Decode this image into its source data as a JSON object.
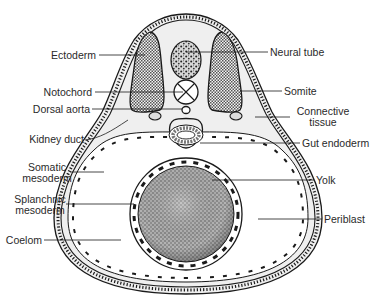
{
  "figure": {
    "caption_fragment": ""
  },
  "labels": {
    "left": [
      {
        "id": "ectoderm",
        "text": "Ectoderm"
      },
      {
        "id": "notochord",
        "text": "Notochord"
      },
      {
        "id": "dorsal_aorta",
        "text": "Dorsal aorta"
      },
      {
        "id": "kidney_duct",
        "text": "Kidney duct"
      },
      {
        "id": "somatic_mesoderm",
        "line1": "Somatic",
        "line2": "mesoderm"
      },
      {
        "id": "splanchnic_mesoderm",
        "line1": "Splanchnic",
        "line2": "mesoderm"
      },
      {
        "id": "coelom",
        "text": "Coelom"
      }
    ],
    "right": [
      {
        "id": "neural_tube",
        "text": "Neural tube"
      },
      {
        "id": "somite",
        "text": "Somite"
      },
      {
        "id": "connective_tissue",
        "line1": "Connective",
        "line2": "tissue"
      },
      {
        "id": "gut_endoderm",
        "text": "Gut endoderm"
      },
      {
        "id": "yolk",
        "text": "Yolk"
      },
      {
        "id": "periblast",
        "text": "Periblast"
      }
    ]
  },
  "colors": {
    "ink": "#1a1a1a",
    "mesenchyme": "#ececec",
    "yolk": "#9a9a9a",
    "background": "#ffffff"
  }
}
